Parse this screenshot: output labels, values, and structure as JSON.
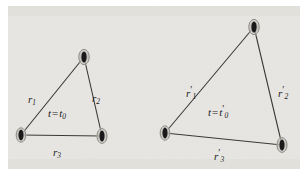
{
  "figure": {
    "background_color": "#e8e6e2",
    "frame_color": "#ffffff",
    "line_color": "#3a3a3a",
    "vertex_fill": "#1a1a1a",
    "vertex_halo": "#bdbab5",
    "text_color": "#1b1b1b",
    "width": 308,
    "height": 177
  },
  "diagrams": [
    {
      "id": "left-triangle",
      "name": "triangle-t0",
      "time_label": {
        "t": "t",
        "equals": "=",
        "t_sub": "t",
        "subscript": "0",
        "prime": "",
        "full_text": "t = t0"
      },
      "vertices": [
        {
          "name": "vertex-top",
          "x": 84,
          "y": 57
        },
        {
          "name": "vertex-bottom-left",
          "x": 21,
          "y": 135
        },
        {
          "name": "vertex-bottom-right",
          "x": 102,
          "y": 136
        }
      ],
      "edges": [
        {
          "name": "edge-r1",
          "label_base": "r",
          "label_sub": "1",
          "label_prime": "",
          "x1": 21,
          "y1": 135,
          "x2": 84,
          "y2": 57,
          "label_x": 28,
          "label_y": 94
        },
        {
          "name": "edge-r2",
          "label_base": "r",
          "label_sub": "2",
          "label_prime": "",
          "x1": 84,
          "y1": 57,
          "x2": 102,
          "y2": 136,
          "label_x": 92,
          "label_y": 93
        },
        {
          "name": "edge-r3",
          "label_base": "r",
          "label_sub": "3",
          "label_prime": "",
          "x1": 21,
          "y1": 135,
          "x2": 102,
          "y2": 136,
          "label_x": 53,
          "label_y": 147
        }
      ],
      "time_label_pos": {
        "x": 48,
        "y": 108
      }
    },
    {
      "id": "right-triangle",
      "name": "triangle-t0-prime",
      "time_label": {
        "t": "t",
        "equals": "=",
        "t_sub": "t",
        "subscript": "0",
        "prime": "′",
        "full_text": "t = t0′"
      },
      "vertices": [
        {
          "name": "vertex-top",
          "x": 254,
          "y": 27
        },
        {
          "name": "vertex-bottom-left",
          "x": 165,
          "y": 133
        },
        {
          "name": "vertex-bottom-right",
          "x": 282,
          "y": 145
        }
      ],
      "edges": [
        {
          "name": "edge-r1-prime",
          "label_base": "r",
          "label_sub": "1",
          "label_prime": "′",
          "x1": 165,
          "y1": 133,
          "x2": 254,
          "y2": 27,
          "label_x": 186,
          "label_y": 85
        },
        {
          "name": "edge-r2-prime",
          "label_base": "r",
          "label_sub": "2",
          "label_prime": "′",
          "x1": 254,
          "y1": 27,
          "x2": 282,
          "y2": 145,
          "label_x": 278,
          "label_y": 85
        },
        {
          "name": "edge-r3-prime",
          "label_base": "r",
          "label_sub": "3",
          "label_prime": "′",
          "x1": 165,
          "y1": 133,
          "x2": 282,
          "y2": 145,
          "label_x": 214,
          "label_y": 148
        }
      ],
      "time_label_pos": {
        "x": 208,
        "y": 104
      }
    }
  ]
}
